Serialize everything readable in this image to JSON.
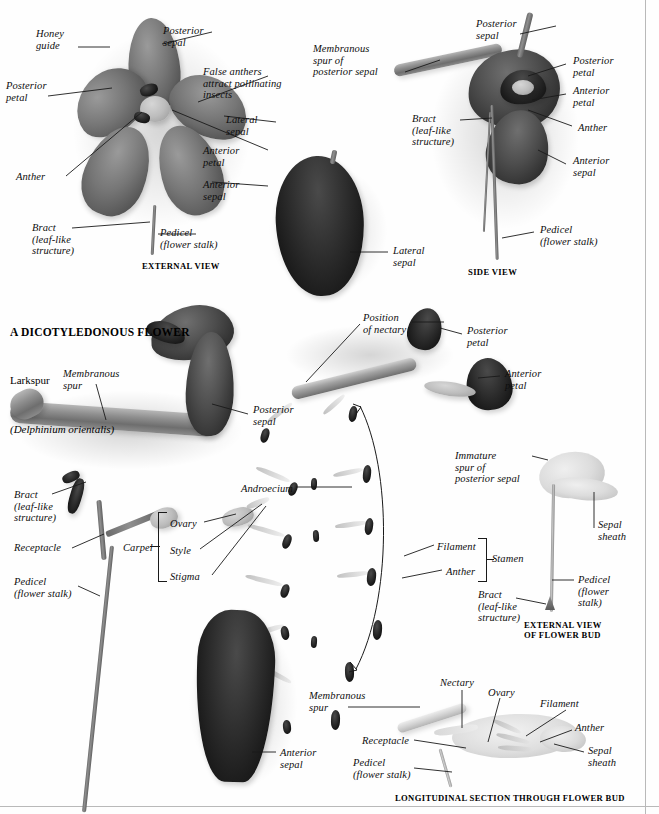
{
  "page": {
    "width": 659,
    "height": 814,
    "background": "#ffffff",
    "ink": "#111111",
    "rule_color": "#b9b9b9"
  },
  "title": {
    "line1": "A DICOTYLEDONOUS FLOWER",
    "line2": "Larkspur",
    "line3": "(Delphinium orientalis)"
  },
  "captions": [
    {
      "name": "caption-external-view",
      "text": "EXTERNAL VIEW",
      "x": 142,
      "y": 261
    },
    {
      "name": "caption-side-view",
      "text": "SIDE VIEW",
      "x": 468,
      "y": 267
    },
    {
      "name": "caption-external-view-of-flower-bud",
      "text": "EXTERNAL VIEW\nOF FLOWER BUD",
      "x": 524,
      "y": 620
    },
    {
      "name": "caption-longitudinal-section",
      "text": "LONGITUDINAL SECTION THROUGH FLOWER BUD",
      "x": 395,
      "y": 793
    }
  ],
  "labels": {
    "external_view": [
      {
        "name": "label-honey-guide",
        "text": "Honey\nguide",
        "x": 36,
        "y": 28,
        "align": "left"
      },
      {
        "name": "label-posterior-sepal-ev",
        "text": "Posterior\nsepal",
        "x": 163,
        "y": 25,
        "align": "left"
      },
      {
        "name": "label-posterior-petal-ev",
        "text": "Posterior\npetal",
        "x": 6,
        "y": 80,
        "align": "left"
      },
      {
        "name": "label-false-anthers",
        "text": "False anthers\nattract pollinating\ninsects",
        "x": 203,
        "y": 66,
        "align": "left"
      },
      {
        "name": "label-lateral-sepal-ev",
        "text": "Lateral\nsepal",
        "x": 226,
        "y": 114,
        "align": "left"
      },
      {
        "name": "label-anterior-petal-ev",
        "text": "Anterior\npetal",
        "x": 203,
        "y": 145,
        "align": "left"
      },
      {
        "name": "label-anther-ev",
        "text": "Anther",
        "x": 16,
        "y": 171,
        "align": "left"
      },
      {
        "name": "label-anterior-sepal-ev",
        "text": "Anterior\nsepal",
        "x": 203,
        "y": 179,
        "align": "left"
      },
      {
        "name": "label-bract-ev",
        "text": "Bract\n(leaf-like\nstructure)",
        "x": 32,
        "y": 222,
        "align": "left"
      },
      {
        "name": "label-pedicel-ev",
        "text": "Pedicel\n(flower stalk)",
        "x": 160,
        "y": 227,
        "align": "left"
      }
    ],
    "side_view": [
      {
        "name": "label-membranous-spur-of-posterior-sepal",
        "text": "Membranous\nspur of\nposterior sepal",
        "x": 313,
        "y": 43,
        "align": "left"
      },
      {
        "name": "label-posterior-sepal-sv",
        "text": "Posterior\nsepal",
        "x": 476,
        "y": 18,
        "align": "left"
      },
      {
        "name": "label-posterior-petal-sv",
        "text": "Posterior\npetal",
        "x": 573,
        "y": 55,
        "align": "left"
      },
      {
        "name": "label-anterior-petal-sv",
        "text": "Anterior\npetal",
        "x": 573,
        "y": 85,
        "align": "left"
      },
      {
        "name": "label-anther-sv",
        "text": "Anther",
        "x": 578,
        "y": 122,
        "align": "left"
      },
      {
        "name": "label-bract-sv",
        "text": "Bract\n(leaf-like\nstructure)",
        "x": 412,
        "y": 113,
        "align": "left"
      },
      {
        "name": "label-anterior-sepal-sv",
        "text": "Anterior\nsepal",
        "x": 573,
        "y": 155,
        "align": "left"
      },
      {
        "name": "label-pedicel-sv",
        "text": "Pedicel\n(flower stalk)",
        "x": 540,
        "y": 224,
        "align": "left"
      }
    ],
    "lateral_sepal_specimen": [
      {
        "name": "label-lateral-sepal-specimen",
        "text": "Lateral\nsepal",
        "x": 393,
        "y": 245,
        "align": "left"
      }
    ],
    "nectary_petals": [
      {
        "name": "label-position-of-nectary",
        "text": "Position\nof nectary",
        "x": 363,
        "y": 312,
        "align": "left"
      },
      {
        "name": "label-posterior-petal-specimen",
        "text": "Posterior\npetal",
        "x": 467,
        "y": 325,
        "align": "left"
      },
      {
        "name": "label-anterior-petal-specimen",
        "text": "Anterior\npetal",
        "x": 505,
        "y": 368,
        "align": "left"
      }
    ],
    "spur_view": [
      {
        "name": "label-membranous-spur",
        "text": "Membranous\nspur",
        "x": 63,
        "y": 368,
        "align": "left"
      },
      {
        "name": "label-posterior-sepal-spur",
        "text": "Posterior\nsepal",
        "x": 253,
        "y": 404,
        "align": "left"
      },
      {
        "name": "label-bract-receptacle",
        "text": "Bract\n(leaf-like\nstructure)",
        "x": 14,
        "y": 489,
        "align": "left"
      },
      {
        "name": "label-receptacle",
        "text": "Receptacle",
        "x": 14,
        "y": 542,
        "align": "left"
      },
      {
        "name": "label-pedicel-spur",
        "text": "Pedicel\n(flower stalk)",
        "x": 14,
        "y": 576,
        "align": "left"
      }
    ],
    "carpel": [
      {
        "name": "label-carpel",
        "text": "Carpel",
        "x": 123,
        "y": 542,
        "align": "left"
      },
      {
        "name": "label-ovary",
        "text": "Ovary",
        "x": 170,
        "y": 518,
        "align": "left"
      },
      {
        "name": "label-style",
        "text": "Style",
        "x": 170,
        "y": 545,
        "align": "left"
      },
      {
        "name": "label-stigma",
        "text": "Stigma",
        "x": 170,
        "y": 571,
        "align": "left"
      }
    ],
    "androecium": [
      {
        "name": "label-androecium",
        "text": "Androecium",
        "x": 241,
        "y": 483,
        "align": "left"
      },
      {
        "name": "label-filament",
        "text": "Filament",
        "x": 437,
        "y": 541,
        "align": "left"
      },
      {
        "name": "label-anther-androecium",
        "text": "Anther",
        "x": 446,
        "y": 566,
        "align": "left"
      },
      {
        "name": "label-stamen",
        "text": "Stamen",
        "x": 492,
        "y": 553,
        "align": "left"
      }
    ],
    "flower_bud": [
      {
        "name": "label-immature-spur",
        "text": "Immature\nspur of\nposterior sepal",
        "x": 455,
        "y": 450,
        "align": "left"
      },
      {
        "name": "label-sepal-sheath-bud",
        "text": "Sepal\nsheath",
        "x": 598,
        "y": 519,
        "align": "left"
      },
      {
        "name": "label-pedicel-bud",
        "text": "Pedicel\n(flower\nstalk)",
        "x": 578,
        "y": 574,
        "align": "left"
      },
      {
        "name": "label-bract-bud",
        "text": "Bract\n(leaf-like\nstructure)",
        "x": 478,
        "y": 589,
        "align": "left"
      }
    ],
    "anterior_sepal_specimen": [
      {
        "name": "label-anterior-sepal-specimen",
        "text": "Anterior\nsepal",
        "x": 280,
        "y": 747,
        "align": "left"
      }
    ],
    "longitudinal_section": [
      {
        "name": "label-membranous-spur-ls",
        "text": "Membranous\nspur",
        "x": 309,
        "y": 690,
        "align": "left"
      },
      {
        "name": "label-nectary",
        "text": "Nectary",
        "x": 440,
        "y": 677,
        "align": "left"
      },
      {
        "name": "label-ovary-ls",
        "text": "Ovary",
        "x": 488,
        "y": 687,
        "align": "left"
      },
      {
        "name": "label-filament-ls",
        "text": "Filament",
        "x": 540,
        "y": 698,
        "align": "left"
      },
      {
        "name": "label-anther-ls",
        "text": "Anther",
        "x": 575,
        "y": 722,
        "align": "left"
      },
      {
        "name": "label-receptacle-ls",
        "text": "Receptacle",
        "x": 362,
        "y": 735,
        "align": "left"
      },
      {
        "name": "label-sepal-sheath-ls",
        "text": "Sepal\nsheath",
        "x": 588,
        "y": 745,
        "align": "left"
      },
      {
        "name": "label-pedicel-ls",
        "text": "Pedicel\n(flower stalk)",
        "x": 353,
        "y": 757,
        "align": "left"
      }
    ]
  }
}
